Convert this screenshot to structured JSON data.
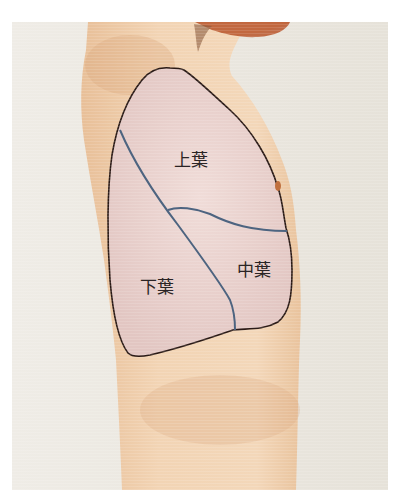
{
  "figure": {
    "colors": {
      "page_bg": "#ffffff",
      "photo_bg": "#e9e5dc",
      "skin": "#efcfae",
      "skin_shadow": "#e2b58e",
      "hair": "#b9552a",
      "lung_fill": "#ead3cf",
      "lung_outline": "#2b1b17",
      "fissure": "#4d6480",
      "nipple": "#c0703f"
    },
    "labels": {
      "upper_lobe": "上葉",
      "middle_lobe": "中葉",
      "lower_lobe": "下葉"
    }
  }
}
